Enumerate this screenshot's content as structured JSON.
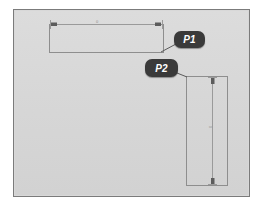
{
  "drawing": {
    "background_color": "#d8d8d8",
    "frame_color": "#7b7b7b",
    "line_color": "#8e8e8e",
    "callout_color": "#3a3a3a",
    "callout_text_color": "#ffffff",
    "title": "Technical drawing with P1 and P2 callouts"
  },
  "callouts": [
    {
      "id": "P1",
      "label": "P1",
      "target": "horizontal-rectangle",
      "leader_from": "badge-lower-left",
      "leader_to": "rectangle-bottom-right-corner"
    },
    {
      "id": "P2",
      "label": "P2",
      "target": "vertical-rectangle",
      "leader_from": "badge-lower-right",
      "leader_to": "rectangle-top-left-corner"
    }
  ],
  "shapes": [
    {
      "name": "horizontal-rectangle",
      "callout": "P1",
      "x": 49,
      "y": 24,
      "width": 114,
      "height": 28,
      "dimension": {
        "orientation": "horizontal",
        "value": "0",
        "position": "top"
      }
    },
    {
      "name": "vertical-rectangle",
      "callout": "P2",
      "x": 186,
      "y": 76,
      "width": 41,
      "height": 109,
      "dimension": {
        "orientation": "vertical",
        "value": "0",
        "position": "right"
      }
    }
  ],
  "dimensions": {
    "horizontal_value": "0",
    "vertical_value": "0"
  }
}
